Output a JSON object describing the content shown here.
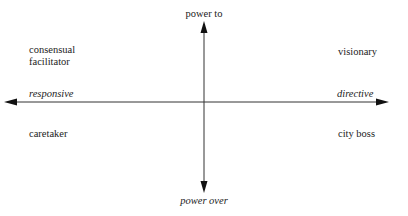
{
  "diagram": {
    "type": "quadrant",
    "vertical_axis": {
      "top_label": "power to",
      "bottom_label": "power over"
    },
    "horizontal_axis": {
      "left_label": "responsive",
      "right_label": "directive"
    },
    "quadrants": {
      "top_left": [
        "consensual",
        "facilitator"
      ],
      "top_right": "visionary",
      "bottom_left": "caretaker",
      "bottom_right": "city boss"
    },
    "colors": {
      "line": "#333333",
      "text": "#222222",
      "background": "#ffffff"
    }
  }
}
